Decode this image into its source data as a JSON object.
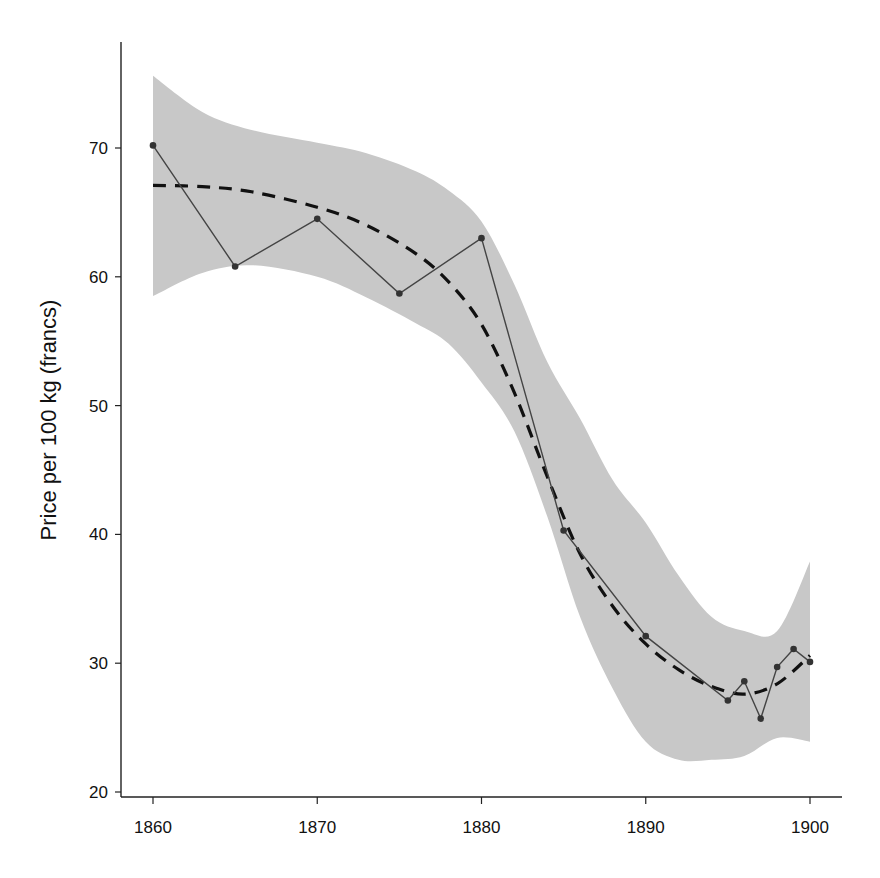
{
  "chart_data": {
    "type": "line",
    "title": "",
    "xlabel": "",
    "ylabel": "Price per 100 kg (francs)",
    "xlim": [
      1858,
      1902
    ],
    "ylim": [
      20,
      77
    ],
    "grid": false,
    "legend": null,
    "x_ticks": [
      1860,
      1870,
      1880,
      1890,
      1900
    ],
    "y_ticks": [
      20,
      30,
      40,
      50,
      60,
      70
    ],
    "series": [
      {
        "name": "Observed price",
        "style": "solid line with dot markers",
        "color": "#444444",
        "x": [
          1860,
          1865,
          1870,
          1875,
          1880,
          1885,
          1890,
          1895,
          1896,
          1897,
          1898,
          1899,
          1900
        ],
        "values": [
          70.2,
          60.8,
          64.5,
          58.7,
          63.0,
          40.3,
          32.1,
          27.1,
          28.6,
          25.7,
          29.7,
          31.1,
          30.1
        ]
      },
      {
        "name": "Smoothed trend",
        "style": "dashed line",
        "color": "#111111",
        "x": [
          1860,
          1863,
          1866,
          1870,
          1873,
          1876,
          1878,
          1880,
          1882,
          1884,
          1886,
          1888,
          1890,
          1892,
          1894,
          1896,
          1898,
          1900
        ],
        "values": [
          67.1,
          67.0,
          66.6,
          65.4,
          64.0,
          61.8,
          59.6,
          56.3,
          51.0,
          44.5,
          38.5,
          34.4,
          31.5,
          29.5,
          28.2,
          27.6,
          28.4,
          30.6
        ]
      },
      {
        "name": "Confidence band",
        "style": "shaded area",
        "color": "#c8c8c8",
        "x": [
          1860,
          1863,
          1866,
          1870,
          1873,
          1876,
          1878,
          1880,
          1882,
          1884,
          1886,
          1888,
          1890,
          1892,
          1894,
          1896,
          1898,
          1900
        ],
        "upper": [
          75.6,
          72.8,
          71.4,
          70.4,
          69.6,
          68.2,
          66.7,
          64.3,
          59.4,
          53.4,
          49.0,
          44.2,
          40.9,
          36.8,
          33.6,
          32.5,
          32.5,
          37.9
        ],
        "lower": [
          58.5,
          60.3,
          60.9,
          60.0,
          58.4,
          56.4,
          54.8,
          51.8,
          48.0,
          41.4,
          33.6,
          28.0,
          23.9,
          22.5,
          22.5,
          22.8,
          24.2,
          23.9
        ]
      }
    ]
  },
  "axes": {
    "y_label": "Price per 100 kg (francs)",
    "x_tick_labels": [
      "1860",
      "1870",
      "1880",
      "1890",
      "1900"
    ],
    "y_tick_labels": [
      "20",
      "30",
      "40",
      "50",
      "60",
      "70"
    ]
  },
  "colors": {
    "band": "#c8c8c8",
    "observed_line": "#444444",
    "marker": "#333333",
    "trend": "#111111",
    "axis": "#222222"
  }
}
